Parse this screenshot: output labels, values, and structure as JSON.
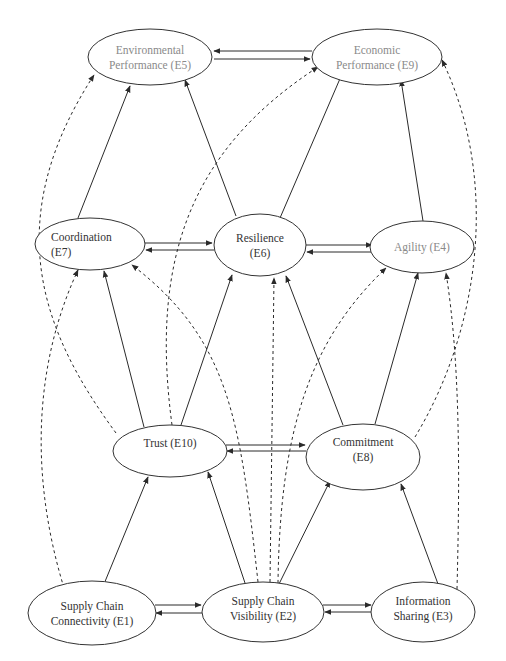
{
  "diagram": {
    "type": "structural-model",
    "colors": {
      "background": "#ffffff",
      "stroke": "#2a2a2a",
      "label_dark": "#333333",
      "label_gray": "#8a8a8a"
    },
    "nodes": [
      {
        "id": "E5",
        "lines": [
          "Environmental",
          "Performance (E5)"
        ],
        "tone": "gray",
        "cx": 150,
        "cy": 57,
        "rx": 62,
        "ry": 28
      },
      {
        "id": "E9",
        "lines": [
          "Economic",
          "Performance (E9)"
        ],
        "tone": "gray",
        "cx": 377,
        "cy": 57,
        "rx": 65,
        "ry": 28
      },
      {
        "id": "E7",
        "lines": [
          "Coordination",
          "(E7)"
        ],
        "tone": "dark",
        "cx": 90,
        "cy": 244,
        "rx": 55,
        "ry": 26,
        "align": "left"
      },
      {
        "id": "E6",
        "lines": [
          "Resilience",
          "(E6)"
        ],
        "tone": "dark",
        "cx": 260,
        "cy": 245,
        "rx": 46,
        "ry": 31
      },
      {
        "id": "E4",
        "lines": [
          "Agility (E4)"
        ],
        "tone": "gray",
        "cx": 422,
        "cy": 247,
        "rx": 52,
        "ry": 26
      },
      {
        "id": "E10",
        "lines": [
          "Trust (E10)"
        ],
        "tone": "dark",
        "cx": 170,
        "cy": 451,
        "rx": 57,
        "ry": 26,
        "text_dy": -8
      },
      {
        "id": "E8",
        "lines": [
          "Commitment",
          "(E8)"
        ],
        "tone": "dark",
        "cx": 363,
        "cy": 457,
        "rx": 57,
        "ry": 33,
        "text_dy": -8
      },
      {
        "id": "E1",
        "lines": [
          "Supply Chain",
          "Connectivity (E1)"
        ],
        "tone": "dark",
        "cx": 92,
        "cy": 613,
        "rx": 64,
        "ry": 32
      },
      {
        "id": "E2",
        "lines": [
          "Supply Chain",
          "Visibility (E2)"
        ],
        "tone": "dark",
        "cx": 263,
        "cy": 612,
        "rx": 61,
        "ry": 30,
        "text_dy": -4
      },
      {
        "id": "E3",
        "lines": [
          "Information",
          "Sharing (E3)"
        ],
        "tone": "dark",
        "cx": 423,
        "cy": 612,
        "rx": 52,
        "ry": 30,
        "text_dy": -4
      }
    ],
    "edges": [
      {
        "from": "E5",
        "to": "E9",
        "style": "solid",
        "d": "M 214 59 L 310 59"
      },
      {
        "from": "E9",
        "to": "E5",
        "style": "solid",
        "d": "M 312 51 L 214 51"
      },
      {
        "from": "E7",
        "to": "E5",
        "style": "solid",
        "d": "M 78 218 L 130 86"
      },
      {
        "from": "E6",
        "to": "E5",
        "style": "solid",
        "d": "M 236 216 L 185 80"
      },
      {
        "from": "E6",
        "to": "E9",
        "style": "solid",
        "d": "M 280 218 L 342 74"
      },
      {
        "from": "E4",
        "to": "E9",
        "style": "solid",
        "d": "M 423 221 L 401 80"
      },
      {
        "from": "E7",
        "to": "E6",
        "style": "solid",
        "d": "M 145 243 L 212 243"
      },
      {
        "from": "E6",
        "to": "E7",
        "style": "solid",
        "d": "M 214 250 L 146 250"
      },
      {
        "from": "E6",
        "to": "E4",
        "style": "solid",
        "d": "M 306 245 L 372 245"
      },
      {
        "from": "E4",
        "to": "E6",
        "style": "solid",
        "d": "M 371 252 L 307 252"
      },
      {
        "from": "E10",
        "to": "E7",
        "style": "solid",
        "d": "M 144 427 L 104 271"
      },
      {
        "from": "E10",
        "to": "E6",
        "style": "solid",
        "d": "M 181 425 L 232 275"
      },
      {
        "from": "E8",
        "to": "E6",
        "style": "solid",
        "d": "M 343 425 L 286 276"
      },
      {
        "from": "E8",
        "to": "E4",
        "style": "solid",
        "d": "M 375 424 L 418 273"
      },
      {
        "from": "E10",
        "to": "E8",
        "style": "solid",
        "d": "M 226 445 L 305 445"
      },
      {
        "from": "E8",
        "to": "E10",
        "style": "solid",
        "d": "M 306 451 L 227 451"
      },
      {
        "from": "E1",
        "to": "E10",
        "style": "solid",
        "d": "M 104 584 L 148 477"
      },
      {
        "from": "E2",
        "to": "E10",
        "style": "solid",
        "d": "M 245 583 L 208 472"
      },
      {
        "from": "E2",
        "to": "E8",
        "style": "solid",
        "d": "M 279 584 L 330 481"
      },
      {
        "from": "E3",
        "to": "E8",
        "style": "solid",
        "d": "M 438 584 L 401 484"
      },
      {
        "from": "E1",
        "to": "E2",
        "style": "solid",
        "d": "M 155 605 L 201 605"
      },
      {
        "from": "E2",
        "to": "E1",
        "style": "solid",
        "d": "M 202 613 L 156 613"
      },
      {
        "from": "E2",
        "to": "E3",
        "style": "solid",
        "d": "M 323 605 L 371 605"
      },
      {
        "from": "E3",
        "to": "E2",
        "style": "solid",
        "d": "M 372 612 L 325 612"
      },
      {
        "from": "E10",
        "to": "E5",
        "style": "dashed",
        "d": "M 116 433 C 40 330, 0 220, 94 75"
      },
      {
        "from": "E1",
        "to": "E7",
        "style": "dashed",
        "d": "M 64 588 C 28 470, 36 360, 78 270"
      },
      {
        "from": "E10",
        "to": "E9",
        "style": "dashed",
        "d": "M 172 425 C 150 260, 190 150, 318 67"
      },
      {
        "from": "E2",
        "to": "E7",
        "style": "dashed",
        "d": "M 258 582 C 240 420, 230 340, 132 265"
      },
      {
        "from": "E2",
        "to": "E6",
        "style": "dashed",
        "d": "M 270 582 L 274 278"
      },
      {
        "from": "E2",
        "to": "E4",
        "style": "dashed",
        "d": "M 278 583 C 280 430, 310 340, 386 268"
      },
      {
        "from": "E8",
        "to": "E9",
        "style": "dashed",
        "d": "M 415 437 C 480 330, 500 180, 442 60"
      },
      {
        "from": "E3",
        "to": "E4",
        "style": "dashed",
        "d": "M 457 589 C 460 470, 460 360, 446 273"
      }
    ]
  }
}
